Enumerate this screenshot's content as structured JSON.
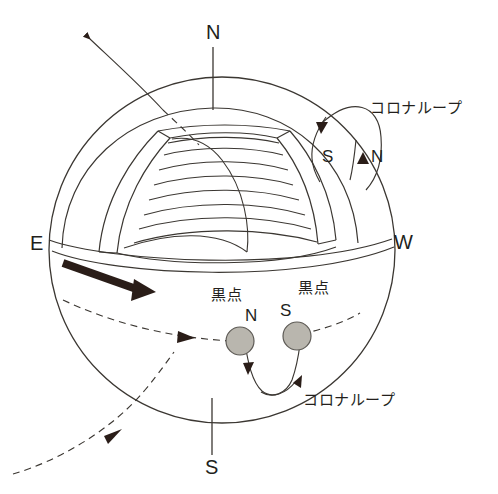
{
  "figure": {
    "type": "diagram",
    "background_color": "#ffffff",
    "line_color": "#3b3732",
    "arrow_color": "#2a1d18",
    "sunspot_fill": "#b9b6ae",
    "sunspot_stroke": "#5d5a55",
    "width": 498,
    "height": 494
  },
  "labels": {
    "pole_north": "N",
    "pole_south": "S",
    "limb_east": "E",
    "limb_west": "W",
    "coronal_loop_top": "コロナループ",
    "coronal_loop_bottom": "コロナループ",
    "sunspot_left": "黒点",
    "sunspot_right": "黒点",
    "sunspot_left_polarity": "N",
    "sunspot_right_polarity": "S",
    "loop_foot_south": "S",
    "loop_foot_north": "N"
  },
  "elements": {
    "solar_disk": "sphere-outline",
    "equator_band": "equatorial-band",
    "polar_axis": "rotation-axis-line",
    "arcade": "helmet-streamer-arcade",
    "rotation_arrow": "differential-rotation-arrow",
    "field_lines_dashed": "open-magnetic-field-lines",
    "coronal_loop_right": "large-coronal-loop",
    "coronal_loop_spots": "sunspot-connecting-loop"
  }
}
